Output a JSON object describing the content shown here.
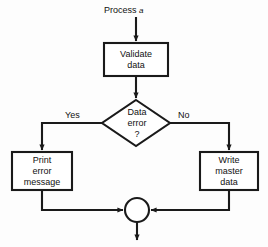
{
  "figure": {
    "background_color": "#fdfdfd",
    "stroke_color": "#1a1a1a",
    "fill_color": "#ffffff",
    "width": 268,
    "height": 247
  },
  "caption": {
    "entry_label_prefix": "Process ",
    "entry_label_term": "a"
  },
  "nodes": {
    "validate": {
      "shape": "process-box",
      "line1": "Validate",
      "line2": "data"
    },
    "decision": {
      "shape": "decision-diamond",
      "line1": "Data",
      "line2": "error",
      "line3": "?"
    },
    "print_error": {
      "shape": "process-box",
      "line1": "Print",
      "line2": "error",
      "line3": "message"
    },
    "write_master": {
      "shape": "process-box",
      "line1": "Write",
      "line2": "master",
      "line3": "data"
    },
    "merge": {
      "shape": "connector-circle",
      "label": ""
    }
  },
  "edges": {
    "yes_label": "Yes",
    "no_label": "No"
  }
}
